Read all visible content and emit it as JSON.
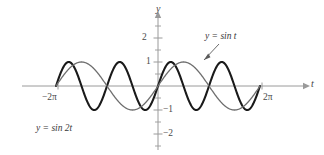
{
  "figure": {
    "background_color": "#ffffff",
    "width": 324,
    "height": 155
  },
  "axes": {
    "x_axis_label": "t",
    "y_axis_label": "y",
    "axis_color": "#9a9a9a",
    "tick_color": "#9a9a9a",
    "y_ticks": [
      {
        "value": 2,
        "label": "2"
      },
      {
        "value": 1,
        "label": "1"
      },
      {
        "value": -1,
        "label": "−1"
      },
      {
        "value": -2,
        "label": "−2"
      }
    ],
    "x_endpoints": [
      {
        "value": -6.283185307,
        "label": "−2π"
      },
      {
        "value": 6.283185307,
        "label": "2π"
      }
    ],
    "xlim": [
      -6.283185307,
      6.283185307
    ],
    "ylim": [
      -2.4,
      2.4
    ]
  },
  "annotations": {
    "sin_t_label": "y = sin t",
    "sin_2t_label": "y = sin 2t"
  },
  "chart_data": {
    "type": "line",
    "title": "",
    "xlabel": "t",
    "ylabel": "y",
    "xlim": [
      -6.283185307,
      6.283185307
    ],
    "ylim": [
      -2.4,
      2.4
    ],
    "grid": false,
    "legend": "inline-annotations",
    "x_tick_labels": [
      "−2π",
      "2π"
    ],
    "y_tick_labels": [
      "2",
      "1",
      "−1",
      "−2"
    ],
    "series": [
      {
        "name": "y = sin t",
        "expression": "sin(t)",
        "color": "#6e6e6e",
        "line_width": 1.3,
        "amplitude": 1,
        "period": 6.283185307,
        "frequency": 1,
        "domain": [
          -6.283185307,
          6.283185307
        ],
        "x": [
          -6.2832,
          -5.8905,
          -5.4978,
          -5.1051,
          -4.7124,
          -4.3197,
          -3.927,
          -3.5343,
          -3.1416,
          -2.7489,
          -2.3562,
          -1.9635,
          -1.5708,
          -1.1781,
          -0.7854,
          -0.3927,
          0.0,
          0.3927,
          0.7854,
          1.1781,
          1.5708,
          1.9635,
          2.3562,
          2.7489,
          3.1416,
          3.5343,
          3.927,
          4.3197,
          4.7124,
          5.1051,
          5.4978,
          5.8905,
          6.2832
        ],
        "y": [
          0.0,
          0.3827,
          0.7071,
          0.9239,
          1.0,
          0.9239,
          0.7071,
          0.3827,
          0.0,
          -0.3827,
          -0.7071,
          -0.9239,
          -1.0,
          -0.9239,
          -0.7071,
          -0.3827,
          0.0,
          0.3827,
          0.7071,
          0.9239,
          1.0,
          0.9239,
          0.7071,
          0.3827,
          0.0,
          -0.3827,
          -0.7071,
          -0.9239,
          -1.0,
          -0.9239,
          -0.7071,
          -0.3827,
          0.0
        ]
      },
      {
        "name": "y = sin 2t",
        "expression": "sin(2t)",
        "color": "#1a1a1a",
        "line_width": 2.1,
        "amplitude": 1,
        "period": 3.141592653,
        "frequency": 2,
        "domain": [
          -6.283185307,
          6.283185307
        ],
        "x": [
          -6.2832,
          -6.0868,
          -5.8905,
          -5.6941,
          -5.4978,
          -5.3014,
          -5.1051,
          -4.9087,
          -4.7124,
          -4.516,
          -4.3197,
          -4.1233,
          -3.927,
          -3.7306,
          -3.5343,
          -3.3379,
          -3.1416,
          -2.9452,
          -2.7489,
          -2.5525,
          -2.3562,
          -2.1598,
          -1.9635,
          -1.7671,
          -1.5708,
          -1.3744,
          -1.1781,
          -0.9817,
          -0.7854,
          -0.589,
          -0.3927,
          -0.1963,
          0.0,
          0.1963,
          0.3927,
          0.589,
          0.7854,
          0.9817,
          1.1781,
          1.3744,
          1.5708,
          1.7671,
          1.9635,
          2.1598,
          2.3562,
          2.5525,
          2.7489,
          2.9452,
          3.1416,
          3.3379,
          3.5343,
          3.7306,
          3.927,
          4.1233,
          4.3197,
          4.516,
          4.7124,
          4.9087,
          5.1051,
          5.3014,
          5.4978,
          5.6941,
          5.8905,
          6.0868,
          6.2832
        ],
        "y": [
          0.0,
          0.3827,
          0.7071,
          0.9239,
          1.0,
          0.9239,
          0.7071,
          0.3827,
          0.0,
          -0.3827,
          -0.7071,
          -0.9239,
          -1.0,
          -0.9239,
          -0.7071,
          -0.3827,
          0.0,
          0.3827,
          0.7071,
          0.9239,
          1.0,
          0.9239,
          0.7071,
          0.3827,
          0.0,
          -0.3827,
          -0.7071,
          -0.9239,
          -1.0,
          -0.9239,
          -0.7071,
          -0.3827,
          0.0,
          0.3827,
          0.7071,
          0.9239,
          1.0,
          0.9239,
          0.7071,
          0.3827,
          0.0,
          -0.3827,
          -0.7071,
          -0.9239,
          -1.0,
          -0.9239,
          -0.7071,
          -0.3827,
          0.0,
          0.3827,
          0.7071,
          0.9239,
          1.0,
          0.9239,
          0.7071,
          0.3827,
          0.0,
          -0.3827,
          -0.7071,
          -0.9239,
          -1.0,
          -0.9239,
          -0.7071,
          -0.3827,
          0.0
        ]
      }
    ]
  }
}
